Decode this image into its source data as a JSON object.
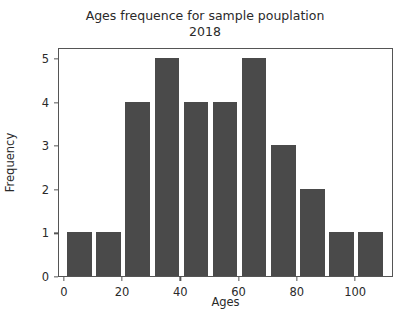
{
  "chart_data": {
    "type": "bar",
    "title": "Ages frequence for sample pouplation\n2018",
    "title_line1": "Ages frequence for sample pouplation",
    "title_line2": "2018",
    "xlabel": "Ages",
    "ylabel": "Frequency",
    "categories": [
      "0-10",
      "10-20",
      "20-30",
      "30-40",
      "40-50",
      "50-60",
      "60-70",
      "70-80",
      "80-90",
      "90-100",
      "100-110"
    ],
    "bin_edges": [
      0,
      10,
      20,
      30,
      40,
      50,
      60,
      70,
      80,
      90,
      100,
      110
    ],
    "x": [
      5,
      15,
      25,
      35,
      45,
      55,
      65,
      75,
      85,
      95,
      105
    ],
    "values": [
      1,
      1,
      4,
      5,
      4,
      4,
      5,
      3,
      2,
      1,
      1
    ],
    "xlim": [
      -2,
      113
    ],
    "ylim": [
      0,
      5.25
    ],
    "xticks": [
      0,
      20,
      40,
      60,
      80,
      100
    ],
    "xtick_labels": [
      "0",
      "20",
      "40",
      "60",
      "80",
      "100"
    ],
    "yticks": [
      0,
      1,
      2,
      3,
      4,
      5
    ],
    "ytick_labels": [
      "0",
      "1",
      "2",
      "3",
      "4",
      "5"
    ],
    "grid": false,
    "legend": null,
    "bar_color": "#4a4a4a",
    "axis_color": "#555555",
    "background_color": "#ffffff"
  }
}
